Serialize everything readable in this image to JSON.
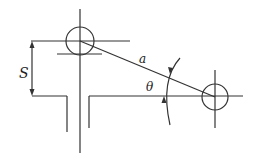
{
  "diagram": {
    "labels": {
      "s": "S",
      "a": "a",
      "theta": "θ"
    },
    "colors": {
      "line": "#333333",
      "background": "#ffffff"
    }
  }
}
